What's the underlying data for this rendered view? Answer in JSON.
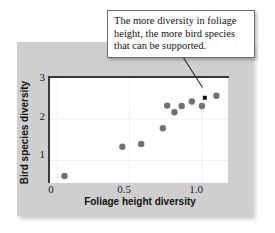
{
  "callout": {
    "text": "The more diversity in foliage height, the more bird species that can be supported."
  },
  "chart_data": {
    "type": "scatter",
    "title": "",
    "xlabel": "Foliage height diversity",
    "ylabel": "Bird species diversity",
    "xlim": [
      -0.05,
      1.18
    ],
    "ylim": [
      0.45,
      3.0
    ],
    "xticks": [
      "0",
      "0.5",
      "1.0"
    ],
    "xtick_values": [
      0,
      0.5,
      1.0
    ],
    "yticks": [
      "1",
      "2",
      "3"
    ],
    "ytick_values": [
      1,
      2,
      3
    ],
    "grid": true,
    "grid_style": "dotted",
    "legend": "none",
    "marker_color": "#717171",
    "highlight_marker_color": "#111111",
    "points": [
      {
        "x": 0.05,
        "y": 0.62
      },
      {
        "x": 0.45,
        "y": 1.33
      },
      {
        "x": 0.58,
        "y": 1.4
      },
      {
        "x": 0.73,
        "y": 1.78
      },
      {
        "x": 0.76,
        "y": 2.33
      },
      {
        "x": 0.81,
        "y": 2.17
      },
      {
        "x": 0.86,
        "y": 2.32
      },
      {
        "x": 0.93,
        "y": 2.43
      },
      {
        "x": 1.0,
        "y": 2.32
      },
      {
        "x": 1.02,
        "y": 2.52,
        "highlight": true
      },
      {
        "x": 1.1,
        "y": 2.57
      }
    ]
  },
  "labels": {
    "x_tick_0": "0",
    "x_tick_1": "0.5",
    "x_tick_2": "1.0",
    "y_tick_0": "1",
    "y_tick_1": "2",
    "y_tick_2": "3"
  }
}
